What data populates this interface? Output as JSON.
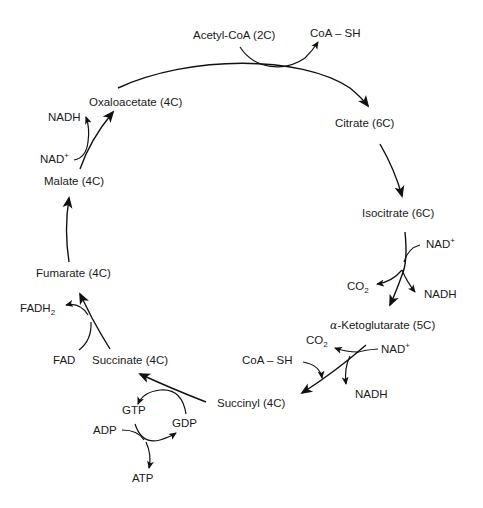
{
  "diagram": {
    "stroke_color": "#111111",
    "background": "#ffffff",
    "intermediates": [
      {
        "id": "acetyl_coa",
        "label": "Acetyl-CoA (2C)"
      },
      {
        "id": "citrate",
        "label": "Citrate (6C)"
      },
      {
        "id": "isocitrate",
        "label": "Isocitrate (6C)"
      },
      {
        "id": "a_ketoglutarate",
        "prefix": "α",
        "label": "-Ketoglutarate (5C)"
      },
      {
        "id": "succinyl",
        "label": "Succinyl (4C)"
      },
      {
        "id": "succinate",
        "label": "Succinate (4C)"
      },
      {
        "id": "fumarate",
        "label": "Fumarate (4C)"
      },
      {
        "id": "malate",
        "label": "Malate (4C)"
      },
      {
        "id": "oxaloacetate",
        "label": "Oxaloacetate (4C)"
      }
    ],
    "cofactors": {
      "coa_sh_top": "CoA – SH",
      "nad_isocitrate": {
        "base": "NAD",
        "sup": "+"
      },
      "co2_isocitrate": {
        "base": "CO",
        "sub": "2"
      },
      "nadh_isocitrate": "NADH",
      "co2_akg": {
        "base": "CO",
        "sub": "2"
      },
      "nad_akg": {
        "base": "NAD",
        "sup": "+"
      },
      "coa_sh_akg": "CoA – SH",
      "nadh_akg": "NADH",
      "gtp": "GTP",
      "gdp": "GDP",
      "adp": "ADP",
      "atp": "ATP",
      "fad": "FAD",
      "fadh2": {
        "base": "FADH",
        "sub": "2"
      },
      "nad_malate": {
        "base": "NAD",
        "sup": "+"
      },
      "nadh_malate": "NADH"
    },
    "steps": [
      {
        "from": "Oxaloacetate (4C)",
        "to": "Citrate (6C)",
        "inputs": [
          "Acetyl-CoA (2C)"
        ],
        "outputs": [
          "CoA – SH"
        ]
      },
      {
        "from": "Citrate (6C)",
        "to": "Isocitrate (6C)",
        "inputs": [],
        "outputs": []
      },
      {
        "from": "Isocitrate (6C)",
        "to": "α-Ketoglutarate (5C)",
        "inputs": [
          "NAD+"
        ],
        "outputs": [
          "CO2",
          "NADH"
        ]
      },
      {
        "from": "α-Ketoglutarate (5C)",
        "to": "Succinyl (4C)",
        "inputs": [
          "NAD+",
          "CoA – SH"
        ],
        "outputs": [
          "CO2",
          "NADH"
        ]
      },
      {
        "from": "Succinyl (4C)",
        "to": "Succinate (4C)",
        "inputs": [
          "GDP",
          "ADP"
        ],
        "outputs": [
          "GTP",
          "ATP"
        ]
      },
      {
        "from": "Succinate (4C)",
        "to": "Fumarate (4C)",
        "inputs": [
          "FAD"
        ],
        "outputs": [
          "FADH2"
        ]
      },
      {
        "from": "Fumarate (4C)",
        "to": "Malate (4C)",
        "inputs": [],
        "outputs": []
      },
      {
        "from": "Malate (4C)",
        "to": "Oxaloacetate (4C)",
        "inputs": [
          "NAD+"
        ],
        "outputs": [
          "NADH"
        ]
      }
    ]
  }
}
